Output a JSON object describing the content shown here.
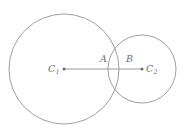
{
  "figure": {
    "background_color": "#ffffff",
    "stroke_color": "#8e8e8e",
    "label_color": "#6f6f6f",
    "width": 188,
    "height": 129
  },
  "labels": {
    "c1": {
      "base": "C",
      "sub": "1"
    },
    "c2": {
      "base": "C",
      "sub": "2"
    },
    "a": {
      "base": "A",
      "sub": ""
    },
    "b": {
      "base": "B",
      "sub": ""
    }
  },
  "chart_data": {
    "type": "diagram",
    "shapes": [
      {
        "name": "large-circle",
        "kind": "circle",
        "cx": 64,
        "cy": 69,
        "r": 55
      },
      {
        "name": "small-circle",
        "kind": "circle",
        "cx": 142,
        "cy": 69,
        "r": 34
      },
      {
        "name": "center-segment",
        "kind": "segment",
        "x1": 64,
        "y1": 69,
        "x2": 142,
        "y2": 69
      }
    ],
    "points": [
      {
        "label": "C1",
        "x": 64,
        "y": 69,
        "marked": true,
        "note": "center of large circle"
      },
      {
        "label": "C2",
        "x": 142,
        "y": 69,
        "marked": true,
        "note": "center of small circle"
      },
      {
        "label": "A",
        "x": 108,
        "y": 69,
        "marked": false,
        "note": "left edge of small circle on segment"
      },
      {
        "label": "B",
        "x": 119,
        "y": 69,
        "marked": false,
        "note": "right edge of large circle on segment"
      }
    ],
    "grid": false,
    "legend": null
  }
}
